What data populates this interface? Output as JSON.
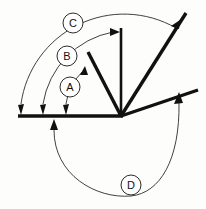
{
  "diagram": {
    "type": "geometry-angle-diagram",
    "colors": {
      "stroke": "#111111",
      "arc": "#2b2b2b",
      "background": "#fdfdfb",
      "label_fill": "#ffffff"
    },
    "vertex": {
      "x": 121,
      "y": 116
    },
    "baseline": {
      "name": "initial-ray",
      "from": {
        "x": 18,
        "y": 116
      },
      "to": {
        "x": 121,
        "y": 116
      }
    },
    "rays": [
      {
        "id": "ray-a",
        "name": "ray-upper-left",
        "label": "A",
        "angle_deg": 125,
        "endpoint": {
          "x": 88,
          "y": 52
        }
      },
      {
        "id": "ray-b",
        "name": "ray-vertical",
        "label": "B",
        "angle_deg": 90,
        "endpoint": {
          "x": 121,
          "y": 28
        }
      },
      {
        "id": "ray-c",
        "name": "ray-diagonal",
        "label": "C",
        "angle_deg": 45,
        "endpoint": {
          "x": 186,
          "y": 13
        }
      },
      {
        "id": "ray-d",
        "name": "ray-shallow-right",
        "label": "D",
        "angle_deg": 14,
        "endpoint": {
          "x": 198,
          "y": 90
        }
      }
    ],
    "arcs": [
      {
        "id": "arc-a",
        "label": "A",
        "direction": "counterclockwise",
        "radius": 56,
        "from_ray": "baseline",
        "to_ray": "ray-a",
        "label_center": {
          "x": 70,
          "y": 87
        },
        "tail_arrow": {
          "x": 66,
          "y": 112
        },
        "head_arrow": {
          "x": 87,
          "y": 66
        }
      },
      {
        "id": "arc-b",
        "label": "B",
        "direction": "counterclockwise",
        "radius": 87,
        "from_ray": "baseline",
        "to_ray": "ray-b",
        "label_center": {
          "x": 67,
          "y": 56
        },
        "tail_arrow": {
          "x": 43,
          "y": 112
        },
        "head_arrow": {
          "x": 116,
          "y": 32
        }
      },
      {
        "id": "arc-c",
        "label": "C",
        "direction": "counterclockwise",
        "radius": 104,
        "from_ray": "baseline",
        "to_ray": "ray-c",
        "label_center": {
          "x": 73,
          "y": 23
        },
        "tail_arrow": {
          "x": 21,
          "y": 112
        },
        "head_arrow": {
          "x": 176,
          "y": 24
        }
      },
      {
        "id": "arc-d",
        "label": "D",
        "direction": "clockwise",
        "radius": 68,
        "from_ray": "baseline",
        "to_ray": "ray-d",
        "label_center": {
          "x": 131,
          "y": 185
        },
        "tail_arrow": {
          "x": 54,
          "y": 122
        },
        "head_arrow": {
          "x": 179,
          "y": 93
        }
      }
    ],
    "labels": [
      {
        "id": "label-a",
        "text": "A",
        "cx": 70,
        "cy": 87,
        "r": 10
      },
      {
        "id": "label-b",
        "text": "B",
        "cx": 67,
        "cy": 56,
        "r": 10
      },
      {
        "id": "label-c",
        "text": "C",
        "cx": 73,
        "cy": 23,
        "r": 10
      },
      {
        "id": "label-d",
        "text": "D",
        "cx": 131,
        "cy": 185,
        "r": 10
      }
    ]
  }
}
